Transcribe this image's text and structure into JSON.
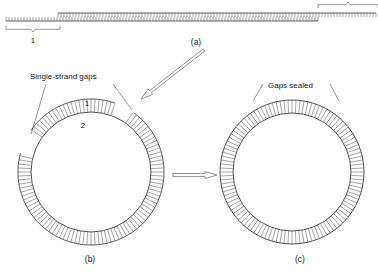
{
  "figure": {
    "width": 378,
    "height": 276,
    "background_color": "#ffffff",
    "line_color": "#3d3d3d",
    "text_color": "#1a1a1a"
  },
  "panels": {
    "a": {
      "caption": "(a)",
      "caption_x": 196,
      "caption_y": 45,
      "description": "linear double-stranded DNA with staggered strand ends",
      "strands": [
        {
          "name": "bottom-strand-left",
          "x1": 6,
          "x2": 318,
          "y": 21,
          "tick_direction": "up",
          "tick_length": 4,
          "tick_count": 104
        },
        {
          "name": "top-strand-right",
          "x1": 58,
          "x2": 376,
          "y": 13,
          "tick_direction": "down",
          "tick_length": 4,
          "tick_count": 106
        }
      ],
      "braces": [
        {
          "name": "brace-segment-1",
          "x1": 6,
          "x2": 60,
          "y": 26,
          "depth": 6,
          "orientation": "down",
          "label": "1",
          "label_x": 33,
          "label_y": 43
        },
        {
          "name": "brace-segment-right",
          "x1": 318,
          "x2": 378,
          "y": 8,
          "depth": 6,
          "orientation": "up",
          "label": "",
          "label_x": 350,
          "label_y": 3
        }
      ]
    },
    "b": {
      "caption": "(b)",
      "caption_x": 90,
      "caption_y": 262,
      "description": "circular duplex DNA containing single-strand gaps",
      "circle": {
        "cx": 91,
        "cy": 172,
        "outer_radius": 73,
        "inner_radius": 60,
        "rung_count": 112
      },
      "annotation": {
        "text": "Single-strand gaps",
        "text_x": 30,
        "text_y": 79,
        "leaders": [
          {
            "x1": 46,
            "y1": 84,
            "x2": 31,
            "y2": 134
          },
          {
            "x1": 113,
            "y1": 84,
            "x2": 132,
            "y2": 110
          }
        ]
      },
      "gaps": [
        {
          "name": "gap-upper-left",
          "start_deg": 196,
          "end_deg": 214
        },
        {
          "name": "gap-upper-right",
          "start_deg": 290,
          "end_deg": 305
        }
      ],
      "strand_labels": [
        {
          "name": "strand-1-label",
          "text": "1",
          "x": 87,
          "y": 106
        },
        {
          "name": "strand-2-label",
          "text": "2",
          "x": 83,
          "y": 128
        }
      ]
    },
    "c": {
      "caption": "(c)",
      "caption_x": 300,
      "caption_y": 262,
      "description": "circular duplex DNA after the gaps have been sealed",
      "circle": {
        "cx": 292,
        "cy": 172,
        "outer_radius": 72,
        "inner_radius": 59,
        "rung_count": 112
      },
      "annotation": {
        "text": "Gaps sealed",
        "text_x": 268,
        "text_y": 88,
        "leaders": [
          {
            "x1": 263,
            "y1": 84,
            "x2": 253,
            "y2": 101
          },
          {
            "x1": 330,
            "y1": 84,
            "x2": 339,
            "y2": 101
          }
        ]
      }
    }
  },
  "arrows": [
    {
      "name": "arrow-a-to-b",
      "kind": "hollow-diagonal",
      "x1": 204,
      "y1": 50,
      "x2": 141,
      "y2": 99,
      "head_width": 7,
      "shaft_width": 2.6
    },
    {
      "name": "arrow-b-to-c",
      "kind": "hollow-horizontal",
      "x1": 173,
      "y1": 175,
      "x2": 217,
      "y2": 175,
      "head_width": 7,
      "shaft_width": 3.2
    }
  ],
  "icons": {
    "arrow_right": "arrow-right-icon",
    "arrow_diagonal": "arrow-diagonal-icon"
  }
}
